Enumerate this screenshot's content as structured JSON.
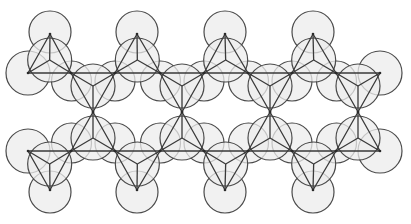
{
  "diagram": {
    "colors": {
      "circle_fill": "#ececec",
      "circle_stroke": "#4a4a4a",
      "line": "#3a3a3a",
      "background": "#ffffff"
    },
    "rows_y": {
      "top_apex": 34,
      "upper_base": 73,
      "mid_apex": 112,
      "lower_base": 151,
      "bottom_apex": 190
    },
    "base_x": [
      28,
      71,
      115,
      160,
      204,
      248,
      292,
      336,
      380
    ],
    "outer_apex_x": [
      50,
      137,
      225,
      313
    ],
    "mid_apex_x": [
      93,
      182,
      270,
      358
    ],
    "circle_radius": 22
  }
}
